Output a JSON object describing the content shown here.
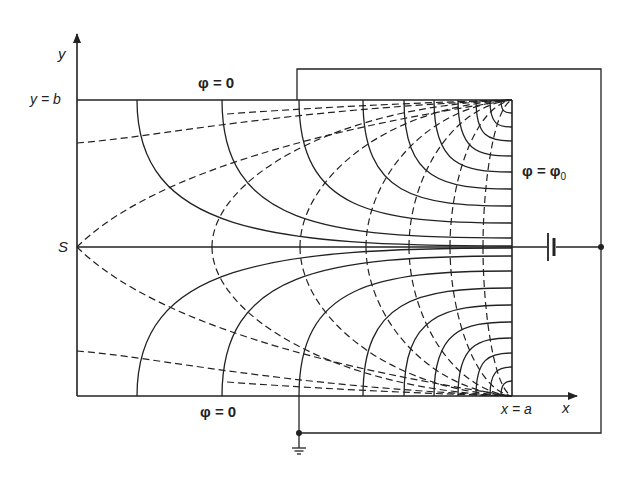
{
  "diagram": {
    "labels": {
      "y_axis": "y",
      "x_axis": "x",
      "y_eq_b": "y = b",
      "x_eq_a": "x = a",
      "origin_S": "S",
      "top_boundary": "φ = 0",
      "bottom_boundary": "φ = 0",
      "right_electrode": "φ = φ0"
    },
    "geometry": {
      "rect": {
        "left": 77,
        "top": 100,
        "right": 512,
        "bottom": 396
      },
      "centerline_y": 247,
      "outer_wire": {
        "top": 69,
        "right": 601,
        "bottom": 433,
        "left_top": 297,
        "left_bottom": 299
      },
      "battery_x": 550,
      "junction_dots": [
        [
          601,
          247
        ],
        [
          299,
          433
        ]
      ],
      "ground": [
        299,
        448
      ]
    },
    "solid_line_ends_on_boundary_x": [
      137,
      222,
      299,
      363,
      404,
      434,
      458,
      476,
      490,
      501
    ],
    "solid_line_ends_on_electrode_dy": [
      146,
      138,
      123,
      106,
      89,
      72,
      56,
      41,
      27,
      13
    ],
    "dashed_line_centerline_x": [
      212,
      300,
      366,
      409,
      450,
      483
    ],
    "dashed_from_left_edge_y_offset": [
      104,
      0
    ],
    "colors": {
      "ink": "#222222",
      "background": "#ffffff"
    }
  }
}
